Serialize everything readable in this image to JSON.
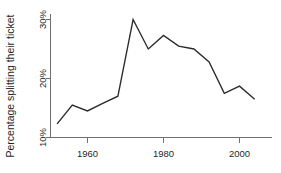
{
  "chart_data": {
    "type": "line",
    "title": "",
    "subtitle": "",
    "xlabel": "",
    "ylabel": "Percentage splitting their ticket",
    "xlim": [
      1950,
      2006
    ],
    "ylim": [
      10,
      31.5
    ],
    "grid": false,
    "legend": null,
    "x_ticks": [
      1960,
      1980,
      2000
    ],
    "x_tick_labels": [
      "1960",
      "1980",
      "2000"
    ],
    "y_ticks": [
      10,
      20,
      30
    ],
    "y_tick_labels": [
      "10%",
      "20%",
      "30%"
    ],
    "series": [
      {
        "name": "Percentage splitting their ticket",
        "color": "#2b2b2b",
        "x": [
          1952,
          1956,
          1960,
          1964,
          1968,
          1972,
          1976,
          1980,
          1984,
          1988,
          1992,
          1996,
          2000,
          2004
        ],
        "values": [
          12.3,
          15.5,
          14.5,
          15.8,
          17.0,
          30.0,
          25.0,
          27.3,
          25.5,
          25.0,
          22.8,
          17.5,
          18.7,
          16.5
        ]
      }
    ]
  },
  "axes": {
    "y_label": "Percentage splitting their ticket",
    "y_tick_0": "10%",
    "y_tick_1": "20%",
    "y_tick_2": "30%",
    "x_tick_0": "1960",
    "x_tick_1": "1980",
    "x_tick_2": "2000"
  }
}
